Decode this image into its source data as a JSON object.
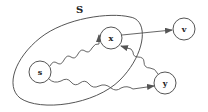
{
  "diagram": {
    "set_label": "S",
    "nodes": [
      {
        "id": "s",
        "label": "s",
        "cx": 40,
        "cy": 72,
        "r": 11
      },
      {
        "id": "x",
        "label": "x",
        "cx": 111,
        "cy": 38,
        "r": 11
      },
      {
        "id": "v",
        "label": "v",
        "cx": 184,
        "cy": 29,
        "r": 11
      },
      {
        "id": "y",
        "label": "y",
        "cx": 165,
        "cy": 83,
        "r": 11
      }
    ],
    "edges": [
      {
        "from": "s",
        "to": "x",
        "style": "wavy"
      },
      {
        "from": "s",
        "to": "y",
        "style": "wavy"
      },
      {
        "from": "y",
        "to": "x",
        "style": "wavy"
      },
      {
        "from": "x",
        "to": "v",
        "style": "straight"
      }
    ],
    "colors": {
      "stroke": "#555555",
      "background": "#ffffff"
    }
  }
}
